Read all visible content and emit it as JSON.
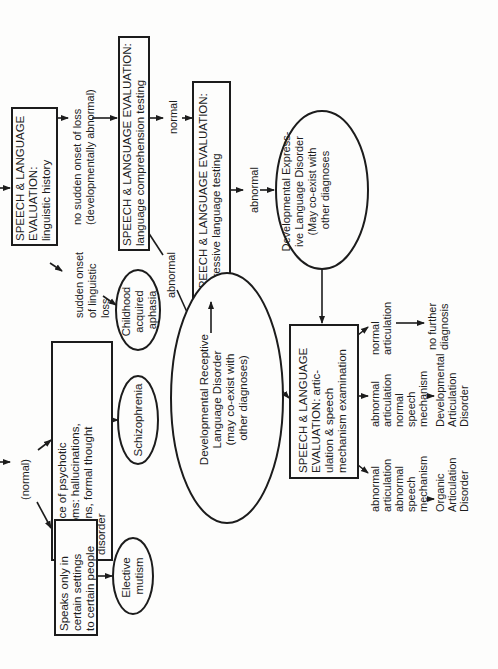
{
  "diagram": {
    "orientation": "rotated 90° counter-clockwise",
    "nodes": {
      "linguistic_history": {
        "lines": [
          "SPEECH & LANGUAGE",
          "EVALUATION:",
          "linguistic history"
        ]
      },
      "comprehension": {
        "lines": [
          "SPEECH & LANGUAGE EVALUATION:",
          "language comprehension testing"
        ]
      },
      "expressive": {
        "lines": [
          "SPEECH & LANGUAGE EVALUATION:",
          "expressive language testing"
        ]
      },
      "expressive_disorder": {
        "lines": [
          "Developmental Express-",
          "ive Language Disorder",
          "(May co-exist with",
          "other diagnoses"
        ]
      },
      "articulation": {
        "lines": [
          "SPEECH & LANGUAGE",
          "EVALUATION: artic-",
          "ulation & speech",
          "mechanism examination"
        ]
      },
      "receptive_disorder": {
        "lines": [
          "Developmental Receptive",
          "Language Disorder",
          "(may co-exist with",
          "other diagnoses)"
        ]
      },
      "childhood_aphasia": {
        "lines": [
          "Childhood",
          "acquired",
          "aphasia"
        ]
      },
      "psychotic": {
        "lines": [
          "Presence of psychotic",
          "symptoms: hallucinations,",
          "delusions, formal thought",
          "disorder"
        ]
      },
      "schizophrenia": {
        "lines": [
          "Schizophrenia"
        ]
      },
      "speaks_only": {
        "lines": [
          "Speaks only in",
          "certain settings",
          "to certain people"
        ]
      },
      "elective_mutism": {
        "lines": [
          "Elective",
          "mutism"
        ]
      }
    },
    "labels": {
      "no_sudden_onset": [
        "no sudden onset of loss",
        "(developmentally abnormal)"
      ],
      "sudden_onset": [
        "sudden onset",
        "of linguistic",
        "loss"
      ],
      "normal_1": [
        "normal"
      ],
      "abnormal_1": [
        "abnormal"
      ],
      "abnormal_2": [
        "abnormal"
      ],
      "normal_2": [
        "normal"
      ],
      "normal_paren": [
        "(normal)"
      ],
      "normal_articulation": [
        "normal",
        "articulation"
      ],
      "no_further": [
        "no further",
        "diagnosis"
      ],
      "abn_art_normal_mech": [
        "abnormal",
        "articulation",
        "normal",
        "speech",
        "mechanism"
      ],
      "developmental_articulation": [
        "Developmental",
        "Articulation",
        "Disorder"
      ],
      "abn_art_abn_mech": [
        "abnormal",
        "articulation",
        "abnormal",
        "speech",
        "mechanism"
      ],
      "organic_articulation": [
        "Organic",
        "Articulation",
        "Disorder"
      ]
    }
  }
}
